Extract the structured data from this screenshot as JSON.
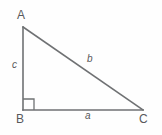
{
  "figure": {
    "kind": "right-triangle-diagram",
    "background_color": "#fefefe",
    "stroke_color": "#6f7173",
    "text_color": "#58595b",
    "stroke_width": 1.6,
    "width": 162,
    "height": 135,
    "vertices": [
      {
        "name": "A",
        "label": "A",
        "x": 23,
        "y": 27
      },
      {
        "name": "B",
        "label": "B",
        "x": 23,
        "y": 110
      },
      {
        "name": "C",
        "label": "C",
        "x": 143,
        "y": 110
      }
    ],
    "sides": [
      {
        "name": "a",
        "label": "a",
        "from": "B",
        "to": "C",
        "role": "base-leg"
      },
      {
        "name": "b",
        "label": "b",
        "from": "A",
        "to": "C",
        "role": "hypotenuse"
      },
      {
        "name": "c",
        "label": "c",
        "from": "A",
        "to": "B",
        "role": "vertical-leg"
      }
    ],
    "right_angle": {
      "at_vertex": "B",
      "marker": "square",
      "size": 11
    }
  }
}
